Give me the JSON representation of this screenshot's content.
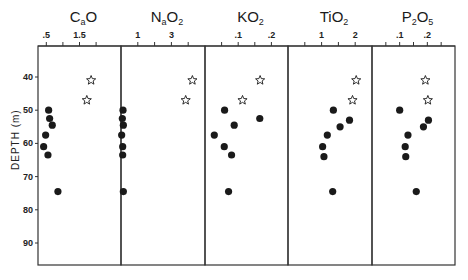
{
  "chart_data": {
    "type": "scatter",
    "layout": "multi-panel depth profile (5 panels sharing y-axis)",
    "ylabel": "DEPTH (m)",
    "y_axis_inverted": true,
    "ylim": [
      30,
      97
    ],
    "yticks": [
      40,
      50,
      60,
      70,
      80,
      90
    ],
    "legend": [
      {
        "marker": "filled-circle",
        "meaning": "samples (no legend text shown)"
      },
      {
        "marker": "open-star",
        "meaning": "samples (no legend text shown)"
      }
    ],
    "panels": [
      {
        "title": "CaO",
        "title_main": "C",
        "title_sub_a": "a",
        "title_rest": "O",
        "title_sub_b": "",
        "xticks": [
          {
            "label": ".5",
            "value": 0.5
          },
          {
            "label": "",
            "value": 1.0
          },
          {
            "label": "1.5",
            "value": 1.5
          },
          {
            "label": "",
            "value": 2.0
          }
        ],
        "xlim": [
          0.25,
          2.75
        ],
        "circles": [
          {
            "x": 0.57,
            "depth": 50
          },
          {
            "x": 0.6,
            "depth": 52.5
          },
          {
            "x": 0.68,
            "depth": 54.5
          },
          {
            "x": 0.48,
            "depth": 57.5
          },
          {
            "x": 0.42,
            "depth": 61
          },
          {
            "x": 0.55,
            "depth": 63.5
          },
          {
            "x": 0.85,
            "depth": 74.5
          }
        ],
        "stars": [
          {
            "x": 1.85,
            "depth": 41
          },
          {
            "x": 1.72,
            "depth": 47
          }
        ]
      },
      {
        "title": "Na2O",
        "title_main": "N",
        "title_sub_a": "a",
        "title_rest": "O",
        "title_sub_b": "2",
        "xticks": [
          {
            "label": "1",
            "value": 1
          },
          {
            "label": "",
            "value": 2
          },
          {
            "label": "3",
            "value": 3
          },
          {
            "label": "",
            "value": 4
          }
        ],
        "xlim": [
          0,
          5
        ],
        "circles": [
          {
            "x": 0.12,
            "depth": 50
          },
          {
            "x": 0.08,
            "depth": 52.5
          },
          {
            "x": 0.14,
            "depth": 54.5
          },
          {
            "x": 0.04,
            "depth": 57.5
          },
          {
            "x": 0.1,
            "depth": 61
          },
          {
            "x": 0.1,
            "depth": 63.5
          },
          {
            "x": 0.14,
            "depth": 74.5
          }
        ],
        "stars": [
          {
            "x": 4.25,
            "depth": 41
          },
          {
            "x": 3.85,
            "depth": 47
          }
        ]
      },
      {
        "title": "K2O",
        "title_main": "K",
        "title_sub_a": "",
        "title_rest": "O",
        "title_sub_b": "2",
        "xticks": [
          {
            "label": "",
            "value": 0.05
          },
          {
            "label": ".1",
            "value": 0.1
          },
          {
            "label": "",
            "value": 0.15
          },
          {
            "label": ".2",
            "value": 0.2
          }
        ],
        "xlim": [
          0,
          0.25
        ],
        "circles": [
          {
            "x": 0.059,
            "depth": 50
          },
          {
            "x": 0.165,
            "depth": 52.5
          },
          {
            "x": 0.088,
            "depth": 54.5
          },
          {
            "x": 0.028,
            "depth": 57.5
          },
          {
            "x": 0.058,
            "depth": 61
          },
          {
            "x": 0.08,
            "depth": 63.5
          },
          {
            "x": 0.071,
            "depth": 74.5
          }
        ],
        "stars": [
          {
            "x": 0.166,
            "depth": 41
          },
          {
            "x": 0.113,
            "depth": 47
          }
        ]
      },
      {
        "title": "TiO2",
        "title_main": "T",
        "title_sub_a": "",
        "title_rest": "iO",
        "title_sub_b": "2",
        "xticks": [
          {
            "label": "",
            "value": 0.5
          },
          {
            "label": "1",
            "value": 1
          },
          {
            "label": "",
            "value": 1.5
          },
          {
            "label": "2",
            "value": 2
          }
        ],
        "xlim": [
          0,
          2.5
        ],
        "circles": [
          {
            "x": 1.35,
            "depth": 50
          },
          {
            "x": 1.83,
            "depth": 53
          },
          {
            "x": 1.55,
            "depth": 55
          },
          {
            "x": 1.17,
            "depth": 57.5
          },
          {
            "x": 1.03,
            "depth": 61
          },
          {
            "x": 1.07,
            "depth": 64
          },
          {
            "x": 1.33,
            "depth": 74.5
          }
        ],
        "stars": [
          {
            "x": 2.03,
            "depth": 41
          },
          {
            "x": 1.92,
            "depth": 47
          }
        ]
      },
      {
        "title": "P2O5",
        "title_main": "P",
        "title_sub_a": "2",
        "title_rest": "O",
        "title_sub_b": "5",
        "xticks": [
          {
            "label": "",
            "value": 0.05
          },
          {
            "label": ".1",
            "value": 0.1
          },
          {
            "label": "",
            "value": 0.15
          },
          {
            "label": ".2",
            "value": 0.2
          },
          {
            "label": "",
            "value": 0.25
          }
        ],
        "xlim": [
          0.0,
          0.3
        ],
        "circles": [
          {
            "x": 0.1,
            "depth": 50
          },
          {
            "x": 0.204,
            "depth": 53
          },
          {
            "x": 0.186,
            "depth": 55
          },
          {
            "x": 0.13,
            "depth": 57.5
          },
          {
            "x": 0.12,
            "depth": 61
          },
          {
            "x": 0.122,
            "depth": 64
          },
          {
            "x": 0.16,
            "depth": 74.5
          }
        ],
        "stars": [
          {
            "x": 0.193,
            "depth": 41
          },
          {
            "x": 0.202,
            "depth": 47
          }
        ]
      }
    ]
  },
  "colors": {
    "ink": "#1a1a1a",
    "frame": "#333333",
    "background": "#ffffff"
  }
}
